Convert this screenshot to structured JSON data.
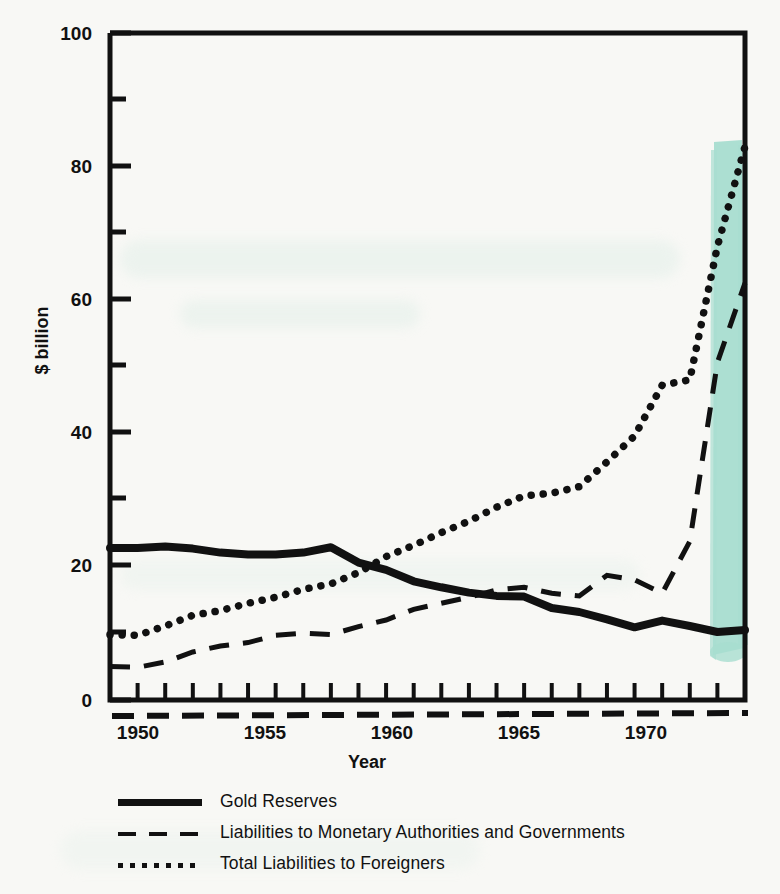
{
  "figure": {
    "background_color": "#f8f8f5",
    "ink_color": "#111111",
    "highlight_color": "#a8ddd0",
    "bleed_text": ""
  },
  "axes": {
    "y_label": "$ billion",
    "x_label": "Year",
    "y_ticks": [
      "0",
      "20",
      "40",
      "60",
      "80",
      "100"
    ],
    "x_ticks": [
      "1950",
      "1955",
      "1960",
      "1965",
      "1970"
    ]
  },
  "legend": {
    "items": [
      {
        "key": "solid",
        "label": "Gold Reserves"
      },
      {
        "key": "dashed",
        "label": "Liabilities to Monetary Authorities and Governments"
      },
      {
        "key": "dotted",
        "label": "Total Liabilities to Foreigners"
      }
    ]
  },
  "chart_data": {
    "type": "line",
    "title": "",
    "xlabel": "Year",
    "ylabel": "$ billion",
    "xlim": [
      1949,
      1972
    ],
    "ylim": [
      0,
      100
    ],
    "y_major_ticks": [
      0,
      20,
      40,
      60,
      80,
      100
    ],
    "y_minor_ticks": [
      10,
      30,
      50,
      70,
      90
    ],
    "x_tick_labels": [
      1950,
      1955,
      1960,
      1965,
      1970
    ],
    "x_tick_every": 1,
    "grid": false,
    "legend_position": "below-axes",
    "x": [
      1949,
      1950,
      1951,
      1952,
      1953,
      1954,
      1955,
      1956,
      1957,
      1958,
      1959,
      1960,
      1961,
      1962,
      1963,
      1964,
      1965,
      1966,
      1967,
      1968,
      1969,
      1970,
      1971,
      1972
    ],
    "series": [
      {
        "name": "Gold Reserves",
        "style": "solid",
        "values": [
          22.8,
          22.8,
          23.0,
          22.7,
          22.1,
          21.8,
          21.8,
          22.1,
          22.9,
          20.6,
          19.5,
          17.8,
          16.9,
          16.1,
          15.6,
          15.5,
          13.8,
          13.2,
          12.1,
          10.9,
          11.9,
          11.1,
          10.2,
          10.5
        ]
      },
      {
        "name": "Liabilities to Monetary Authorities and Governments",
        "style": "dashed",
        "values": [
          5.0,
          4.9,
          5.7,
          7.2,
          8.1,
          8.6,
          9.7,
          10.0,
          9.8,
          11.0,
          12.0,
          13.6,
          14.5,
          15.4,
          16.5,
          16.9,
          16.0,
          15.6,
          18.7,
          18.0,
          16.0,
          23.8,
          50.6,
          62.5
        ]
      },
      {
        "name": "Total Liabilities to Foreigners",
        "style": "dotted",
        "values": [
          9.8,
          9.7,
          11.1,
          12.7,
          13.4,
          14.5,
          15.4,
          16.6,
          17.4,
          19.1,
          21.5,
          23.2,
          25.1,
          26.8,
          28.9,
          30.6,
          31.0,
          32.0,
          35.7,
          39.6,
          47.2,
          48.0,
          68.0,
          83.0
        ]
      }
    ]
  }
}
